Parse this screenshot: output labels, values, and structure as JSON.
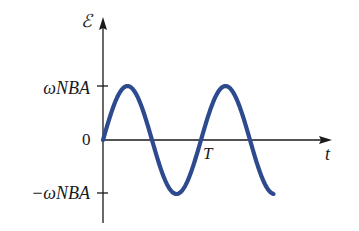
{
  "chart_data": {
    "type": "line",
    "title": "",
    "xlabel": "t",
    "ylabel": "ℰ",
    "series": [
      {
        "name": "EMF",
        "function": "ωNBA·sin(2πt/T)",
        "color": "#2e4a8e",
        "x_range_in_periods": [
          0,
          1.75
        ]
      }
    ],
    "x_ticks": [
      {
        "label": "T",
        "value_in_periods": 1
      }
    ],
    "y_ticks": [
      {
        "label": "ωNBA",
        "value": 1
      },
      {
        "label": "0",
        "value": 0
      },
      {
        "label": "−ωNBA",
        "value": -1
      }
    ],
    "ylim": [
      -1,
      1
    ],
    "grid": false,
    "legend": null
  },
  "labels": {
    "y_axis": "ℰ",
    "x_axis": "t",
    "y_max": "ωNBA",
    "y_zero": "0",
    "y_min": "−ωNBA",
    "period": "T"
  },
  "geometry": {
    "origin_x": 103,
    "origin_y": 140,
    "period_px": 98,
    "amplitude_px": 54,
    "periods_drawn": 1.74,
    "x_axis_end": 332,
    "y_axis_top": 17,
    "y_axis_bottom": 223
  },
  "colors": {
    "curve": "#2e4a8e",
    "axes": "#1a1a1a"
  }
}
